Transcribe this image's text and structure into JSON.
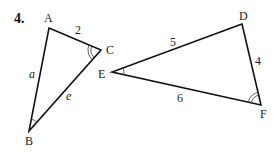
{
  "problem_number": "4.",
  "colors": {
    "stroke": "#111111",
    "text": "#222222",
    "background": "#ffffff"
  },
  "triangles": [
    {
      "id": "ABC",
      "vertices": {
        "A": {
          "label": "A",
          "x": 49,
          "y": 28
        },
        "B": {
          "label": "B",
          "x": 29,
          "y": 131
        },
        "C": {
          "label": "C",
          "x": 101,
          "y": 50
        }
      },
      "sides": {
        "AC": {
          "label": "2"
        },
        "AB": {
          "label": "a"
        },
        "BC": {
          "label": "e"
        }
      },
      "angle_marks": {
        "C": "double-arc",
        "B": "single-arc"
      }
    },
    {
      "id": "DEF",
      "vertices": {
        "D": {
          "label": "D",
          "x": 242,
          "y": 24
        },
        "E": {
          "label": "E",
          "x": 112,
          "y": 72
        },
        "F": {
          "label": "F",
          "x": 261,
          "y": 105
        }
      },
      "sides": {
        "DE": {
          "label": "5"
        },
        "DF": {
          "label": "4"
        },
        "EF": {
          "label": "6"
        }
      },
      "angle_marks": {
        "E": "single-arc",
        "F": "double-arc"
      }
    }
  ]
}
